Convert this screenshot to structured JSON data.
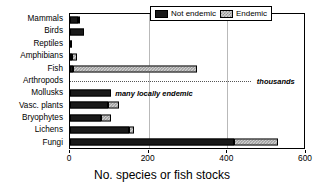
{
  "chart_data": {
    "type": "bar",
    "orientation": "horizontal",
    "stacked": true,
    "title": "",
    "xlabel": "No. species or fish stocks",
    "ylabel": "",
    "xlim": [
      0,
      600
    ],
    "xticks": [
      0,
      200,
      400,
      600
    ],
    "grid": true,
    "grid_axis": "x",
    "legend_position": "top-right",
    "categories": [
      "Mammals",
      "Birds",
      "Reptiles",
      "Amphibians",
      "Fish",
      "Arthropods",
      "Mollusks",
      "Vasc. plants",
      "Bryophytes",
      "Lichens",
      "Fungi"
    ],
    "series": [
      {
        "name": "Not endemic",
        "color": "#1a1a1a",
        "values": [
          20,
          35,
          2,
          3,
          8,
          0,
          103,
          97,
          78,
          150,
          418
        ]
      },
      {
        "name": "Endemic",
        "color": "#cfcfcf",
        "values": [
          2,
          0,
          0,
          12,
          314,
          0,
          0,
          28,
          27,
          12,
          110
        ]
      }
    ],
    "totals": [
      22,
      35,
      2,
      15,
      322,
      0,
      103,
      125,
      105,
      162,
      528
    ],
    "annotations": [
      {
        "category": "Arthropods",
        "text": "thousands",
        "style": "bold-italic",
        "marker": "dotted-line"
      },
      {
        "category": "Mollusks",
        "text": "many locally endemic",
        "style": "bold-italic"
      }
    ]
  },
  "legend": {
    "items": [
      {
        "label": "Not endemic",
        "swatch": "dark-solid-swatch"
      },
      {
        "label": "Endemic",
        "swatch": "light-hatched-swatch"
      }
    ]
  },
  "axis": {
    "x_title": "No. species or fish stocks",
    "x_tick_labels": [
      "0",
      "200",
      "400",
      "600"
    ]
  }
}
